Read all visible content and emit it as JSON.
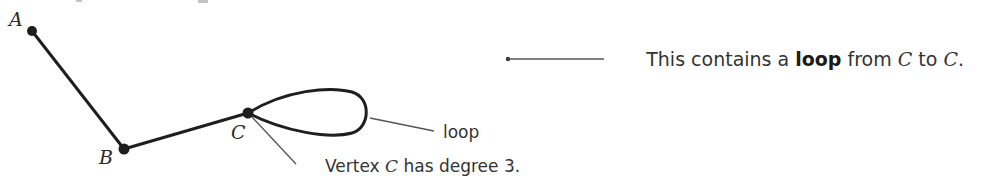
{
  "diagram": {
    "vertices": [
      {
        "id": "A",
        "label": "A",
        "x": 32,
        "y": 31
      },
      {
        "id": "B",
        "label": "B",
        "x": 124,
        "y": 149
      },
      {
        "id": "C",
        "label": "C",
        "x": 248,
        "y": 113
      }
    ],
    "edges": [
      {
        "from": "A",
        "to": "B"
      },
      {
        "from": "B",
        "to": "C"
      },
      {
        "from": "C",
        "to": "C",
        "type": "loop"
      }
    ],
    "annotations": {
      "loop_label": "loop",
      "degree_prefix": "Vertex ",
      "degree_vertex": "C",
      "degree_suffix": " has degree 3.",
      "callout_prefix": "This contains a ",
      "callout_bold": "loop",
      "callout_mid": " from ",
      "callout_v1": "C",
      "callout_to": " to ",
      "callout_v2": "C",
      "callout_end": "."
    },
    "colors": {
      "edge": "#1e1e1e",
      "leader": "#555555",
      "text": "#333333"
    }
  }
}
